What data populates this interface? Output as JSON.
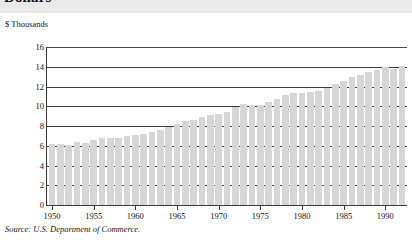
{
  "title": "Dollars",
  "unit_label": "$ Thousands",
  "source_note": "Source: U.S. Department of Commerce.",
  "colors": {
    "bar": "#d6d6d6",
    "gridline": "#3b3b3b",
    "text": "#141414",
    "title_band": "#e9e9e9"
  },
  "chart_data": {
    "type": "bar",
    "title": "Dollars",
    "xlabel": "",
    "ylabel": "$ Thousands",
    "ylim": [
      0,
      16
    ],
    "yticks": [
      0,
      2,
      4,
      6,
      8,
      10,
      12,
      14,
      16
    ],
    "xticks": [
      1950,
      1955,
      1960,
      1965,
      1970,
      1975,
      1980,
      1985,
      1990
    ],
    "xlim": [
      1949.4,
      1992.6
    ],
    "grid": true,
    "legend": "none",
    "source": "Source: U.S. Department of Commerce.",
    "categories": [
      1950,
      1951,
      1952,
      1953,
      1954,
      1955,
      1956,
      1957,
      1958,
      1959,
      1960,
      1961,
      1962,
      1963,
      1964,
      1965,
      1966,
      1967,
      1968,
      1969,
      1970,
      1971,
      1972,
      1973,
      1974,
      1975,
      1976,
      1977,
      1978,
      1979,
      1980,
      1981,
      1982,
      1983,
      1984,
      1985,
      1986,
      1987,
      1988,
      1989,
      1990,
      1991,
      1992
    ],
    "values": [
      6.2,
      6.2,
      6.1,
      6.4,
      6.3,
      6.6,
      6.8,
      6.8,
      6.8,
      7.0,
      7.1,
      7.2,
      7.4,
      7.6,
      7.9,
      8.2,
      8.5,
      8.6,
      8.9,
      9.1,
      9.2,
      9.4,
      9.9,
      10.2,
      10.1,
      10.1,
      10.4,
      10.7,
      11.1,
      11.3,
      11.3,
      11.4,
      11.5,
      11.8,
      12.3,
      12.6,
      13.0,
      13.2,
      13.5,
      13.7,
      14.0,
      13.8,
      14.1
    ]
  }
}
